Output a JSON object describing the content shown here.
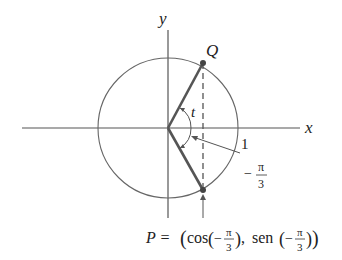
{
  "diagram": {
    "axis_labels": {
      "x": "x",
      "y": "y"
    },
    "points": {
      "Q": "Q",
      "P_prefix": "P ="
    },
    "angle_label": "t",
    "tick_label_one": "1",
    "angle_value": {
      "sign": "−",
      "numerator": "π",
      "denominator": "3"
    },
    "formula": {
      "open": "(",
      "cos": "cos",
      "sep": ",",
      "sen": "sen",
      "close": ")",
      "neg": "−",
      "num": "π",
      "den": "3"
    },
    "colors": {
      "line": "#555555",
      "thick": "#555555",
      "point": "#444444"
    }
  }
}
